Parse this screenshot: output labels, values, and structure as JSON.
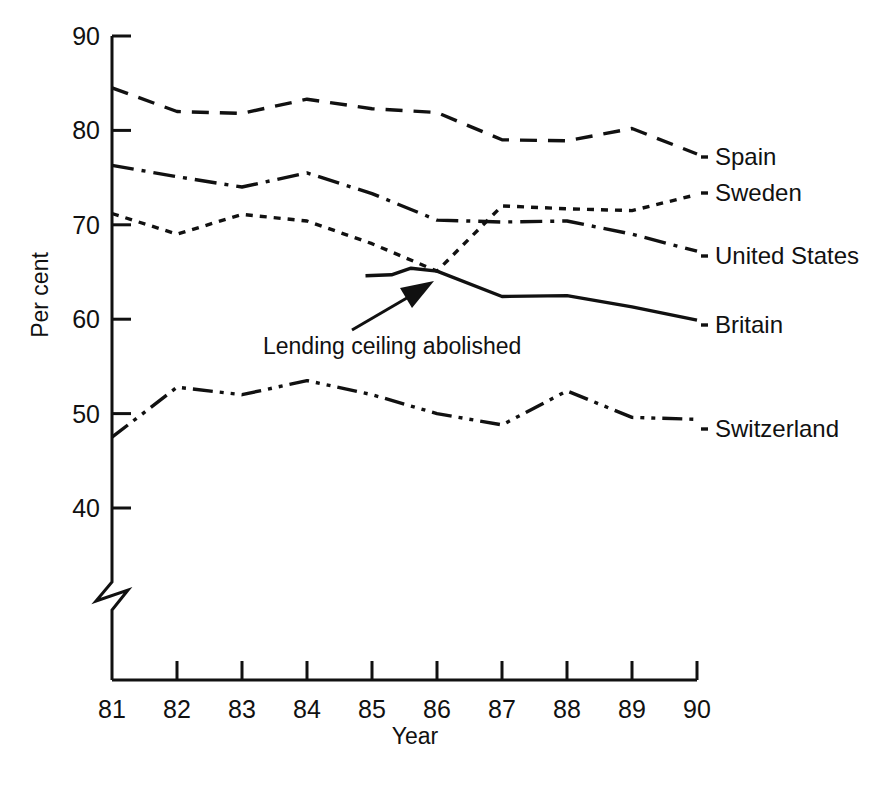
{
  "chart_data": {
    "type": "line",
    "title": "",
    "xlabel": "Year",
    "ylabel": "Per cent",
    "x": [
      81,
      82,
      83,
      84,
      85,
      86,
      87,
      88,
      89,
      90
    ],
    "xtick_labels": [
      "81",
      "82",
      "83",
      "84",
      "85",
      "86",
      "87",
      "88",
      "89",
      "90"
    ],
    "ytick_labels": [
      "90",
      "80",
      "70",
      "60",
      "50",
      "40"
    ],
    "ytick_values": [
      90,
      80,
      70,
      60,
      50,
      40
    ],
    "ylim": [
      40,
      90
    ],
    "xlim": [
      81,
      90
    ],
    "grid": false,
    "axis_break": true,
    "axis_break_note": "y-axis broken below 40",
    "legend_position": "right-inline",
    "series": [
      {
        "name": "Spain",
        "label": "Spain",
        "style": "dashed",
        "color": "#111111",
        "x": [
          81,
          82,
          83,
          84,
          85,
          86,
          87,
          88,
          89,
          90
        ],
        "values": [
          84.5,
          82.0,
          81.8,
          83.3,
          82.3,
          81.9,
          79.0,
          78.9,
          80.2,
          77.5
        ]
      },
      {
        "name": "Sweden",
        "label": "Sweden",
        "style": "dotted",
        "color": "#111111",
        "x": [
          81,
          82,
          83,
          84,
          85,
          86,
          87,
          88,
          89,
          90
        ],
        "values": [
          71.2,
          69.0,
          71.1,
          70.4,
          68.0,
          65.1,
          72.0,
          71.7,
          71.5,
          73.2
        ]
      },
      {
        "name": "United States",
        "label": "United States",
        "style": "dash-dot",
        "color": "#111111",
        "x": [
          81,
          82,
          83,
          84,
          85,
          86,
          87,
          88,
          89,
          90
        ],
        "values": [
          76.3,
          75.1,
          74.0,
          75.5,
          73.3,
          70.5,
          70.3,
          70.4,
          69.0,
          67.2
        ]
      },
      {
        "name": "Britain",
        "label": "Britain",
        "style": "solid",
        "color": "#111111",
        "x": [
          84.9,
          85.3,
          85.6,
          86.0,
          87.0,
          88.0,
          89.0,
          90.0
        ],
        "values": [
          64.6,
          64.7,
          65.4,
          65.1,
          62.4,
          62.5,
          61.3,
          59.9
        ]
      },
      {
        "name": "Switzerland",
        "label": "Switzerland",
        "style": "dash-dot-dot",
        "color": "#111111",
        "x": [
          81,
          82,
          83,
          84,
          85,
          86,
          87,
          88,
          89,
          90
        ],
        "values": [
          47.5,
          52.8,
          52.0,
          53.5,
          52.0,
          50.0,
          48.8,
          52.4,
          49.6,
          49.4
        ]
      }
    ],
    "annotations": [
      {
        "text": "Lending ceiling abolished",
        "target_x": 86.0,
        "target_y": 65.0,
        "kind": "arrow-callout"
      }
    ]
  }
}
